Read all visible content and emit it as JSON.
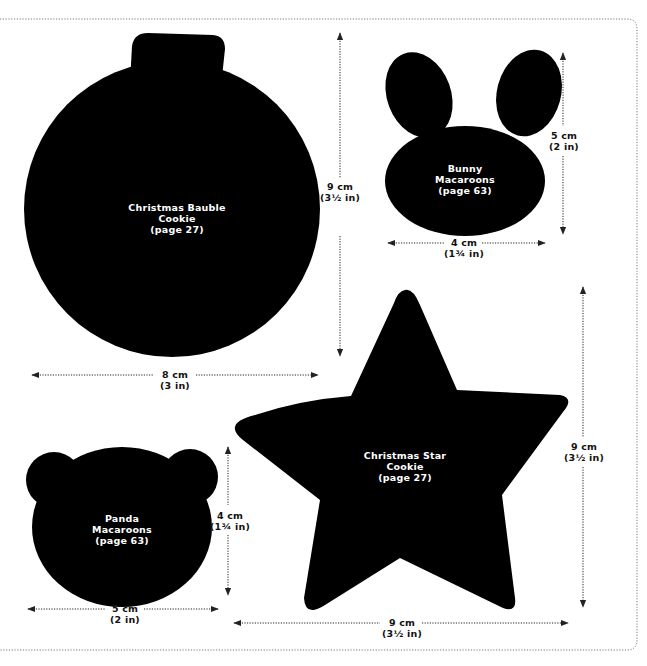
{
  "colors": {
    "shape_fill": "#000000",
    "background": "#ffffff",
    "dimension_line": "#222222",
    "cut_border": "#666666"
  },
  "templates": [
    {
      "id": "bauble",
      "name_line1": "Christmas Bauble",
      "name_line2": "Cookie",
      "page_ref": "(page 27)",
      "height": {
        "cm": "9 cm",
        "in": "(3½ in)"
      },
      "width": {
        "cm": "8 cm",
        "in": "(3 in)"
      }
    },
    {
      "id": "bunny",
      "name_line1": "Bunny",
      "name_line2": "Macaroons",
      "page_ref": "(page 63)",
      "height": {
        "cm": "5 cm",
        "in": "(2 in)"
      },
      "width": {
        "cm": "4 cm",
        "in": "(1¾ in)"
      }
    },
    {
      "id": "star",
      "name_line1": "Christmas Star",
      "name_line2": "Cookie",
      "page_ref": "(page 27)",
      "height": {
        "cm": "9 cm",
        "in": "(3½ in)"
      },
      "width": {
        "cm": "9 cm",
        "in": "(3½ in)"
      }
    },
    {
      "id": "panda",
      "name_line1": "Panda",
      "name_line2": "Macaroons",
      "page_ref": "(page 63)",
      "height": {
        "cm": "4 cm",
        "in": "(1¾ in)"
      },
      "width": {
        "cm": "5 cm",
        "in": "(2 in)"
      }
    }
  ]
}
